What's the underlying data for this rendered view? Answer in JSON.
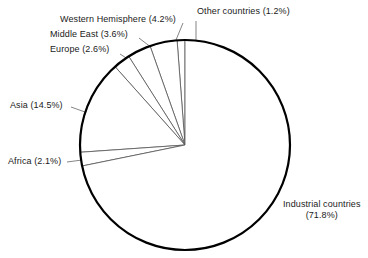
{
  "chart_data": {
    "type": "pie",
    "title": "",
    "subtitle": "",
    "xlabel": "",
    "ylabel": "",
    "legend_position": "none",
    "grid": false,
    "unit": "%",
    "categories": [
      "Other countries",
      "Western Hemisphere",
      "Middle East",
      "Europe",
      "Asia",
      "Africa",
      "Industrial countries"
    ],
    "values": [
      1.2,
      4.2,
      3.6,
      2.6,
      14.5,
      2.1,
      71.8
    ],
    "slices": [
      {
        "name": "other-countries",
        "label": "Other countries",
        "value": 1.2,
        "value_text": "(1.2%)",
        "label_text": "Other countries (1.2%)",
        "color": "#ffffff"
      },
      {
        "name": "western-hemisphere",
        "label": "Western Hemisphere",
        "value": 4.2,
        "value_text": "(4.2%)",
        "label_text": "Western Hemisphere (4.2%)",
        "color": "#ffffff"
      },
      {
        "name": "middle-east",
        "label": "Middle East",
        "value": 3.6,
        "value_text": "(3.6%)",
        "label_text": "Middle East (3.6%)",
        "color": "#ffffff"
      },
      {
        "name": "europe",
        "label": "Europe",
        "value": 2.6,
        "value_text": "(2.6%)",
        "label_text": "Europe (2.6%)",
        "color": "#ffffff"
      },
      {
        "name": "asia",
        "label": "Asia",
        "value": 14.5,
        "value_text": "(14.5%)",
        "label_text": "Asia (14.5%)",
        "color": "#ffffff"
      },
      {
        "name": "africa",
        "label": "Africa",
        "value": 2.1,
        "value_text": "(2.1%)",
        "label_text": "Africa (2.1%)",
        "color": "#ffffff"
      },
      {
        "name": "industrial-countries",
        "label": "Industrial countries",
        "value": 71.8,
        "value_text": "(71.8%)",
        "label_line1": "Industrial countries",
        "label_line2": "(71.8%)",
        "label_text": "Industrial countries (71.8%)",
        "color": "#ffffff"
      }
    ],
    "colors": {
      "slice_fill": "#ffffff",
      "outline": "#000000",
      "divider": "#555555",
      "leader": "#666666",
      "text": "#1a1a1a",
      "background": "#ffffff"
    },
    "geometry": {
      "center_x": 185,
      "center_y": 145,
      "radius": 105,
      "start_angle_deg": 90,
      "direction": "counterclockwise"
    }
  }
}
